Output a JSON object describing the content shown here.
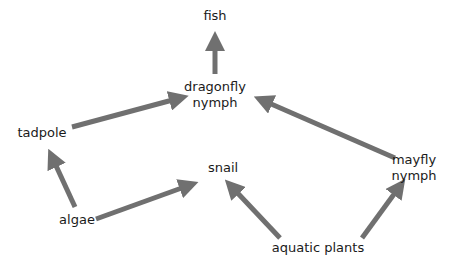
{
  "diagram": {
    "type": "food-web",
    "arrow_color": "#707070",
    "nodes": {
      "fish": {
        "label": "fish",
        "x": 215,
        "y": 8
      },
      "dragonfly_nymph": {
        "label_line1": "dragonfly",
        "label_line2": "nymph",
        "x": 215,
        "y": 79
      },
      "tadpole": {
        "label": "tadpole",
        "x": 42,
        "y": 126
      },
      "snail": {
        "label": "snail",
        "x": 224,
        "y": 160
      },
      "mayfly_nymph": {
        "label_line1": "mayfly",
        "label_line2": "nymph",
        "x": 414,
        "y": 152
      },
      "algae": {
        "label": "algae",
        "x": 78,
        "y": 212
      },
      "aquatic_plants": {
        "label": "aquatic plants",
        "x": 315,
        "y": 240
      }
    },
    "edges": [
      {
        "from": "dragonfly nymph",
        "to": "fish"
      },
      {
        "from": "tadpole",
        "to": "dragonfly nymph"
      },
      {
        "from": "mayfly nymph",
        "to": "dragonfly nymph"
      },
      {
        "from": "algae",
        "to": "tadpole"
      },
      {
        "from": "algae",
        "to": "snail"
      },
      {
        "from": "aquatic plants",
        "to": "snail"
      },
      {
        "from": "aquatic plants",
        "to": "mayfly nymph"
      }
    ]
  }
}
